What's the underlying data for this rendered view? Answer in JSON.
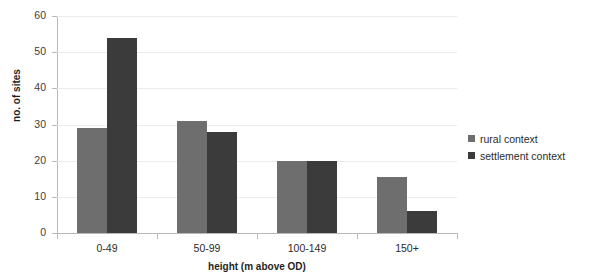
{
  "chart_data": {
    "type": "bar",
    "title": "",
    "categories": [
      "0-49",
      "50-99",
      "100-149",
      "150+"
    ],
    "series": [
      {
        "name": "rural context",
        "color": "#6e6e6e",
        "values": [
          29,
          31,
          20,
          15.5
        ]
      },
      {
        "name": "settlement context",
        "color": "#3b3b3b",
        "values": [
          54,
          28,
          20,
          6
        ]
      }
    ],
    "xlabel": "height (m above OD)",
    "ylabel": "no. of sites",
    "ylim": [
      0,
      60
    ],
    "ytick_step": 10,
    "yticks": [
      "60",
      "50",
      "40",
      "30",
      "20",
      "10",
      "0"
    ],
    "grid": true,
    "legend_position": "right"
  },
  "axes": {
    "y_title": "no. of sites",
    "x_title": "height (m above OD)"
  },
  "legend": {
    "items": [
      {
        "label": "rural context",
        "color": "#6e6e6e"
      },
      {
        "label": "settlement context",
        "color": "#3b3b3b"
      }
    ]
  }
}
